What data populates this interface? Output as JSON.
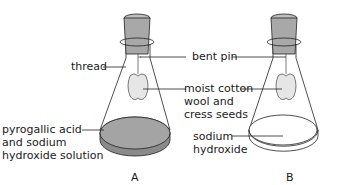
{
  "diagram": {
    "labels": {
      "thread": "thread",
      "bent_pin": "bent pin",
      "moist_cotton_1": "moist cotton",
      "moist_cotton_2": "wool and",
      "moist_cotton_3": "cress seeds",
      "pyrogallic_1": "pyrogallic acid",
      "pyrogallic_2": "and sodium",
      "pyrogallic_3": "hydroxide solution",
      "sodium_1": "sodium",
      "sodium_2": "hydroxide"
    },
    "flasks": [
      {
        "id": "A",
        "label": "A",
        "solution": "pyrogallic acid and sodium hydroxide solution"
      },
      {
        "id": "B",
        "label": "B",
        "solution": "sodium hydroxide"
      }
    ],
    "colors": {
      "stopper": "#a8a8a8",
      "solution_A": "#a0a0a0",
      "outline": "#222222"
    }
  }
}
